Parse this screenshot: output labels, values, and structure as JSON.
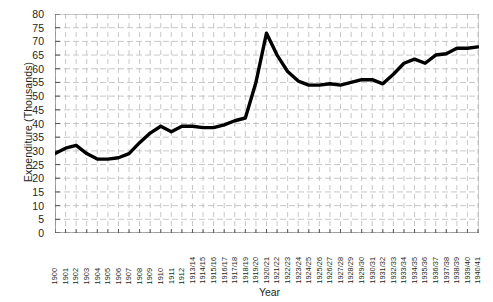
{
  "chart_data": {
    "type": "line",
    "title": "",
    "xlabel": "Year",
    "ylabel": "Expenditure (Thousands)",
    "ylim": [
      0,
      80
    ],
    "ytick_step": 5,
    "yticks": [
      0,
      5,
      10,
      15,
      20,
      25,
      30,
      35,
      40,
      45,
      50,
      55,
      60,
      65,
      70,
      75,
      80
    ],
    "grid": true,
    "grid_style": "dashed",
    "legend": null,
    "line_color": "#000000",
    "line_width": 3.4,
    "categories": [
      "1900",
      "1901",
      "1902",
      "1903",
      "1904",
      "1905",
      "1906",
      "1907",
      "1908",
      "1909",
      "1910",
      "1911",
      "1912",
      "1913/14",
      "1914/15",
      "1915/16",
      "1916/17",
      "1917/18",
      "1918/19",
      "1919/20",
      "1920/21",
      "1921/22",
      "1922/23",
      "1923/24",
      "1924/25",
      "1925/26",
      "1926/27",
      "1927/28",
      "1928/29",
      "1929/30",
      "1930/31",
      "1931/32",
      "1932/33",
      "1933/34",
      "1934/35",
      "1935/36",
      "1936/37",
      "1937/38",
      "1938/39",
      "1939/40",
      "1940/41"
    ],
    "values": [
      29,
      31,
      32,
      29,
      27,
      27,
      27.5,
      29,
      33,
      36.5,
      39,
      37,
      39,
      39,
      38.5,
      38.5,
      39.5,
      41,
      42,
      55,
      73,
      65,
      59,
      55.5,
      54,
      54,
      54.5,
      54,
      55,
      56,
      56,
      54.5,
      58,
      62,
      63.5,
      62,
      65,
      65.5,
      67.5,
      67.5,
      68
    ]
  }
}
